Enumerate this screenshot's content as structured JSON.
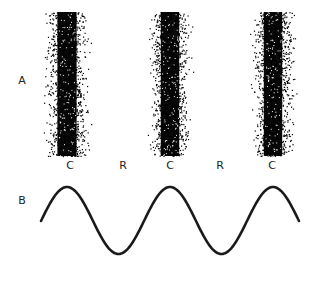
{
  "panel_a": {
    "label": "A",
    "bands": [
      {
        "center_x": 67,
        "width": 48
      },
      {
        "center_x": 170,
        "width": 46
      },
      {
        "center_x": 273,
        "width": 46
      }
    ],
    "band_top": 12,
    "band_bottom": 156,
    "zone_labels": [
      {
        "text": "C",
        "x": 70
      },
      {
        "text": "R",
        "x": 123
      },
      {
        "text": "C",
        "x": 170
      },
      {
        "text": "R",
        "x": 220
      },
      {
        "text": "C",
        "x": 272
      }
    ]
  },
  "panel_b": {
    "label": "B",
    "wave": {
      "x_start": 41,
      "x_end": 299,
      "peak_y": 187,
      "trough_y": 254,
      "first_peak_x": 67,
      "period": 103
    }
  }
}
